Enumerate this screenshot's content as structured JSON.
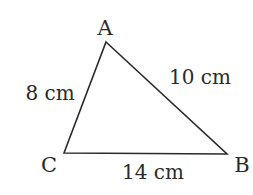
{
  "diagram": {
    "type": "triangle",
    "stroke_color": "#2a2a2a",
    "text_color": "#2a2a2a",
    "vertices": [
      {
        "name": "A",
        "x": 106,
        "y": 42,
        "label_x": 105,
        "label_y": 35
      },
      {
        "name": "B",
        "x": 227,
        "y": 154,
        "label_x": 242,
        "label_y": 172
      },
      {
        "name": "C",
        "x": 64,
        "y": 153,
        "label_x": 49,
        "label_y": 172
      }
    ],
    "sides": [
      {
        "between": "A-C",
        "label": "8 cm",
        "label_x": 50,
        "label_y": 100
      },
      {
        "between": "A-B",
        "label": "10 cm",
        "label_x": 200,
        "label_y": 84
      },
      {
        "between": "C-B",
        "label": "14 cm",
        "label_x": 153,
        "label_y": 179
      }
    ]
  }
}
